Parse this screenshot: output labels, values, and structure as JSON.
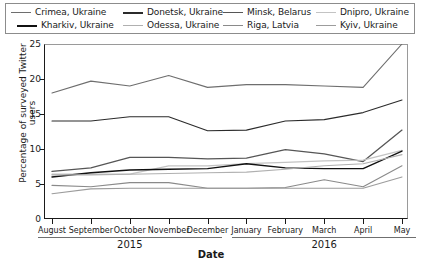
{
  "chart_data": {
    "type": "line",
    "title": "",
    "xlabel": "Date",
    "ylabel": "Percentage of surveyed Twitter users",
    "categories": [
      "August",
      "September",
      "October",
      "November",
      "December",
      "January",
      "February",
      "March",
      "April",
      "May"
    ],
    "year_groups": [
      {
        "label": "2015",
        "months": [
          "August",
          "September",
          "October",
          "November",
          "December"
        ]
      },
      {
        "label": "2016",
        "months": [
          "January",
          "February",
          "March",
          "April",
          "May"
        ]
      }
    ],
    "ylim": [
      0,
      25
    ],
    "yticks": [
      0,
      5,
      10,
      15,
      20,
      25
    ],
    "grid": false,
    "legend_position": "top",
    "series": [
      {
        "name": "Crimea, Ukraine",
        "color": "#6e6e6e",
        "width": 1.1,
        "values": [
          18.0,
          19.7,
          19.0,
          20.5,
          18.8,
          19.2,
          19.2,
          19.0,
          18.8,
          25.0
        ]
      },
      {
        "name": "Donetsk, Ukraine",
        "color": "#2b2b2b",
        "width": 1.1,
        "values": [
          14.0,
          14.0,
          14.6,
          14.6,
          12.6,
          12.7,
          14.0,
          14.2,
          15.2,
          17.0
        ]
      },
      {
        "name": "Minsk, Belarus",
        "color": "#565656",
        "width": 1.3,
        "values": [
          6.8,
          7.3,
          8.8,
          8.8,
          8.6,
          8.7,
          9.9,
          9.3,
          8.2,
          12.7
        ]
      },
      {
        "name": "Dnipro, Ukraine",
        "color": "#c3c3c3",
        "width": 1.2,
        "values": [
          6.4,
          6.4,
          6.4,
          7.6,
          7.6,
          7.9,
          8.1,
          8.3,
          8.4,
          9.8
        ]
      },
      {
        "name": "Kharkiv, Ukraine",
        "color": "#111111",
        "width": 1.4,
        "values": [
          6.0,
          6.6,
          7.0,
          7.1,
          7.2,
          7.9,
          7.3,
          7.2,
          7.2,
          9.7
        ]
      },
      {
        "name": "Odessa, Ukraine",
        "color": "#b0b0b0",
        "width": 1.1,
        "values": [
          6.3,
          6.3,
          6.4,
          6.5,
          6.6,
          6.7,
          7.1,
          7.6,
          7.9,
          9.2
        ]
      },
      {
        "name": "Riga, Latvia",
        "color": "#8a8a8a",
        "width": 1.1,
        "values": [
          4.8,
          4.6,
          5.2,
          5.2,
          4.4,
          4.4,
          4.5,
          5.6,
          4.6,
          7.6
        ]
      },
      {
        "name": "Kyiv, Ukraine",
        "color": "#9c9c9c",
        "width": 1.1,
        "values": [
          3.6,
          4.3,
          4.4,
          4.4,
          4.4,
          4.4,
          4.4,
          4.4,
          4.4,
          6.0
        ]
      }
    ]
  },
  "legend": {
    "rows": [
      [
        {
          "label": "Crimea, Ukraine",
          "color": "#6e6e6e",
          "width": 1.2
        },
        {
          "label": "Donetsk, Ukraine",
          "color": "#2b2b2b",
          "width": 2.0
        },
        {
          "label": "Minsk, Belarus",
          "color": "#565656",
          "width": 1.8
        },
        {
          "label": "Dnipro, Ukraine",
          "color": "#c3c3c3",
          "width": 1.2
        }
      ],
      [
        {
          "label": "Kharkiv, Ukraine",
          "color": "#111111",
          "width": 2.2
        },
        {
          "label": "Odessa, Ukraine",
          "color": "#b0b0b0",
          "width": 1.3
        },
        {
          "label": "Riga, Latvia",
          "color": "#8a8a8a",
          "width": 1.8
        },
        {
          "label": "Kyiv, Ukraine",
          "color": "#9c9c9c",
          "width": 1.8
        }
      ]
    ]
  }
}
